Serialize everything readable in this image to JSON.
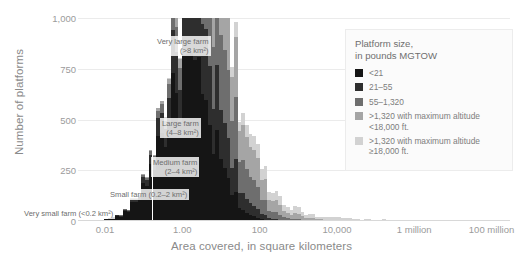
{
  "chart_data": {
    "type": "bar",
    "title": "",
    "xlabel": "Area covered, in square kilometers",
    "ylabel": "Number of platforms",
    "xscale": "log",
    "xlim": [
      0.002,
      300000000
    ],
    "ylim": [
      0,
      1000
    ],
    "grid": true,
    "xticks": [
      {
        "value": 0.01,
        "label": "0.01"
      },
      {
        "value": 1.0,
        "label": "1.00"
      },
      {
        "value": 100,
        "label": "100"
      },
      {
        "value": 10000,
        "label": "10,000"
      },
      {
        "value": 1000000,
        "label": "1 million"
      },
      {
        "value": 100000000,
        "label": "100 million"
      }
    ],
    "yticks": [
      {
        "value": 0,
        "label": "0"
      },
      {
        "value": 250,
        "label": "250"
      },
      {
        "value": 500,
        "label": "500"
      },
      {
        "value": 750,
        "label": "750"
      },
      {
        "value": 1000,
        "label": "1,000"
      }
    ],
    "legend": {
      "position": "top-right",
      "title_line1": "Platform size,",
      "title_line2": "in pounds MGTOW",
      "entries": [
        {
          "label": "<21",
          "color": "#151515"
        },
        {
          "label": "21–55",
          "color": "#2e2e2e"
        },
        {
          "label": "55–1,320",
          "color": "#6e6e6e"
        },
        {
          "label": ">1,320 with maximum altitude <18,000 ft.",
          "color": "#a5a5a5"
        },
        {
          "label": ">1,320 with maximum altitude ≥18,000 ft.",
          "color": "#d2d2d2"
        }
      ]
    },
    "annotations": [
      {
        "name": "very-large-farm",
        "line1": "Very large farm",
        "line2": "(>8 km²)",
        "x_px": 155,
        "y_px": 36
      },
      {
        "name": "large-farm",
        "line1": "Large farm",
        "line2": "(4–8 km²)",
        "x_px": 160,
        "y_px": 118
      },
      {
        "name": "medium-farm",
        "line1": "Medium farm",
        "line2": "(2–4 km²)",
        "x_px": 151,
        "y_px": 157
      },
      {
        "name": "small-farm",
        "line1": "Small farm (0.2–2 km²)",
        "line2": "",
        "x_px": 108,
        "y_px": 189
      },
      {
        "name": "very-small-farm",
        "line1": "Very small farm (<0.2 km²)",
        "line2": "",
        "x_px": 22,
        "y_px": 208
      }
    ],
    "series": [
      {
        "name": "<21",
        "color": "#151515",
        "values": [
          2,
          3,
          4,
          6,
          8,
          11,
          15,
          20,
          28,
          38,
          52,
          70,
          95,
          125,
          160,
          205,
          260,
          310,
          360,
          410,
          455,
          500,
          545,
          590,
          640,
          690,
          720,
          700,
          660,
          615,
          565,
          510,
          455,
          395,
          335,
          275,
          225,
          180,
          140,
          108,
          82,
          60,
          43,
          30,
          21,
          14,
          9,
          6,
          4,
          3,
          2,
          1,
          1,
          1,
          0,
          0,
          0,
          0,
          0,
          0,
          0,
          0,
          0,
          0,
          0,
          0,
          0,
          0,
          0,
          0,
          0,
          0,
          0,
          0,
          0,
          0,
          0,
          0,
          0,
          0,
          0,
          0,
          0,
          0,
          0,
          0,
          0,
          0,
          0,
          0,
          0,
          0,
          0,
          0,
          0,
          0,
          0,
          0,
          0,
          0,
          0,
          0,
          0,
          0,
          0,
          0,
          0,
          0,
          0,
          0,
          0,
          0,
          0,
          0,
          0,
          0,
          0,
          0,
          0,
          0
        ]
      },
      {
        "name": "21-55",
        "color": "#2e2e2e",
        "values": [
          0,
          0,
          0,
          0,
          0,
          1,
          1,
          2,
          3,
          4,
          6,
          9,
          13,
          18,
          25,
          34,
          45,
          58,
          74,
          92,
          112,
          135,
          160,
          188,
          218,
          248,
          278,
          300,
          312,
          316,
          310,
          298,
          282,
          262,
          240,
          216,
          192,
          168,
          146,
          124,
          104,
          86,
          70,
          56,
          44,
          34,
          26,
          19,
          14,
          10,
          7,
          5,
          4,
          3,
          2,
          1,
          1,
          1,
          0,
          0,
          0,
          0,
          0,
          0,
          0,
          0,
          0,
          0,
          0,
          0,
          0,
          0,
          0,
          0,
          0,
          0,
          0,
          0,
          0,
          0,
          0,
          0,
          0,
          0,
          0,
          0,
          0,
          0,
          0,
          0,
          0,
          0,
          0,
          0,
          0,
          0,
          0,
          0,
          0,
          0,
          0,
          0,
          0,
          0,
          0,
          0,
          0,
          0,
          0,
          0,
          0,
          0,
          0,
          0,
          0,
          0,
          0,
          0,
          0,
          0
        ]
      },
      {
        "name": "55-1,320",
        "color": "#6e6e6e",
        "values": [
          0,
          0,
          0,
          0,
          0,
          0,
          0,
          0,
          1,
          1,
          2,
          3,
          4,
          6,
          9,
          12,
          17,
          23,
          31,
          41,
          54,
          70,
          90,
          115,
          145,
          180,
          220,
          262,
          300,
          332,
          356,
          370,
          374,
          368,
          354,
          334,
          310,
          284,
          256,
          228,
          200,
          174,
          150,
          128,
          108,
          90,
          74,
          60,
          48,
          38,
          30,
          23,
          18,
          14,
          11,
          8,
          6,
          5,
          4,
          3,
          2,
          2,
          1,
          1,
          1,
          1,
          0,
          0,
          0,
          0,
          0,
          0,
          0,
          0,
          0,
          0,
          0,
          0,
          0,
          0,
          0,
          0,
          0,
          0,
          0,
          0,
          0,
          0,
          0,
          0,
          0,
          0,
          0,
          0,
          0,
          0,
          0,
          0,
          0,
          0,
          0,
          0,
          0,
          0,
          0,
          0,
          0,
          0,
          0,
          0,
          0,
          0,
          0,
          0,
          0,
          0,
          0,
          0,
          0,
          0
        ]
      },
      {
        "name": ">1,320 <18,000 ft",
        "color": "#a5a5a5",
        "values": [
          0,
          0,
          0,
          0,
          0,
          0,
          0,
          0,
          0,
          0,
          0,
          1,
          1,
          2,
          3,
          4,
          6,
          8,
          11,
          15,
          20,
          27,
          36,
          48,
          62,
          80,
          100,
          124,
          150,
          178,
          205,
          230,
          250,
          265,
          272,
          272,
          266,
          255,
          240,
          223,
          204,
          185,
          166,
          148,
          131,
          115,
          100,
          87,
          75,
          64,
          55,
          47,
          40,
          34,
          29,
          24,
          21,
          18,
          15,
          13,
          11,
          9,
          8,
          7,
          6,
          5,
          5,
          4,
          4,
          3,
          3,
          3,
          2,
          2,
          2,
          2,
          1,
          1,
          1,
          1,
          1,
          1,
          1,
          1,
          1,
          1,
          0,
          0,
          0,
          0,
          0,
          0,
          0,
          0,
          0,
          0,
          0,
          0,
          0,
          0,
          0,
          0,
          0,
          0,
          0,
          0,
          0,
          0,
          0,
          0,
          0,
          0,
          0,
          0,
          0,
          0,
          0,
          0,
          0,
          0
        ]
      },
      {
        "name": ">1,320 >=18,000 ft",
        "color": "#d2d2d2",
        "values": [
          0,
          0,
          0,
          0,
          0,
          0,
          0,
          0,
          0,
          0,
          0,
          0,
          0,
          0,
          0,
          0,
          0,
          0,
          0,
          0,
          1,
          1,
          2,
          3,
          4,
          5,
          7,
          9,
          12,
          15,
          19,
          23,
          28,
          33,
          38,
          43,
          48,
          52,
          56,
          59,
          61,
          62,
          62,
          61,
          59,
          57,
          54,
          51,
          48,
          45,
          42,
          39,
          36,
          33,
          31,
          28,
          26,
          24,
          22,
          20,
          19,
          17,
          16,
          15,
          14,
          13,
          12,
          11,
          10,
          10,
          9,
          8,
          8,
          7,
          7,
          6,
          6,
          5,
          5,
          5,
          4,
          4,
          4,
          3,
          3,
          3,
          3,
          2,
          2,
          2,
          2,
          2,
          2,
          1,
          1,
          1,
          1,
          1,
          1,
          1,
          1,
          1,
          1,
          1,
          1,
          0,
          0,
          0,
          0,
          0,
          0,
          0,
          0,
          0,
          0,
          0,
          0,
          0,
          0,
          0
        ]
      }
    ],
    "bin_start_exponent": -2.4,
    "bin_width_decades": 0.0958,
    "jitter_seed": 17
  }
}
